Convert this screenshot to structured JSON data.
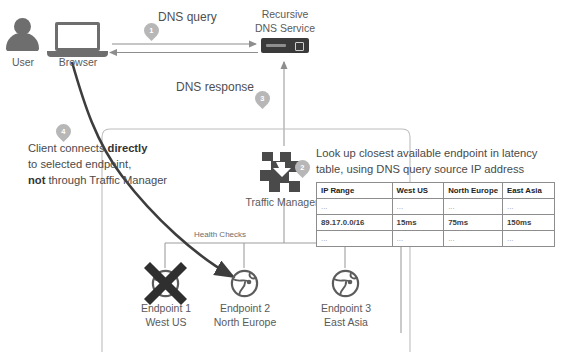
{
  "diagram": {
    "nodes": {
      "user": {
        "label": "User",
        "icon": "user-icon"
      },
      "browser": {
        "label": "Browser",
        "icon": "laptop-icon"
      },
      "recursive_dns": {
        "label_line1": "Recursive",
        "label_line2": "DNS Service",
        "icon": "server-icon"
      },
      "traffic_manager": {
        "label": "Traffic Manager",
        "icon": "traffic-manager-icon"
      },
      "endpoint1": {
        "label_line1": "Endpoint 1",
        "label_line2": "West US",
        "icon": "globe-icon",
        "status": "unavailable"
      },
      "endpoint2": {
        "label_line1": "Endpoint 2",
        "label_line2": "North Europe",
        "icon": "globe-icon",
        "status": "available"
      },
      "endpoint3": {
        "label_line1": "Endpoint 3",
        "label_line2": "East Asia",
        "icon": "globe-icon",
        "status": "available"
      }
    },
    "flow_labels": {
      "dns_query": "DNS query",
      "dns_response": "DNS response",
      "health_checks": "Health Checks"
    },
    "steps": [
      {
        "number": "1",
        "near": "dns-query-arrow"
      },
      {
        "number": "2",
        "near": "traffic-manager"
      },
      {
        "number": "3",
        "near": "dns-response-arrow"
      },
      {
        "number": "4",
        "near": "client-direct-connect"
      }
    ],
    "notes": {
      "client_connect": {
        "line1_pre": "Client connects ",
        "line1_bold": "directly",
        "line2": "to selected endpoint,",
        "line3_bold": "not",
        "line3_post": " through Traffic Manager"
      },
      "lookup": "Look up closest available endpoint in latency table, using DNS query source IP address"
    },
    "latency_table": {
      "headers": [
        "IP Range",
        "West US",
        "North Europe",
        "East Asia"
      ],
      "rows": [
        {
          "cells": [
            "...",
            "...",
            "...",
            "..."
          ],
          "highlight": false
        },
        {
          "cells": [
            "89.17.0.0/16",
            "15ms",
            "75ms",
            "150ms"
          ],
          "highlight": true
        },
        {
          "cells": [
            "...",
            "...",
            "...",
            "..."
          ],
          "highlight": false
        }
      ]
    },
    "colors": {
      "icon_dark": "#5c5c5c",
      "icon_black": "#2f2f2f",
      "badge_gray": "#b7b7b7",
      "wire_gray": "#9a9a9a",
      "arrow_dark": "#4a4a4a",
      "text": "#4a4a4a"
    }
  }
}
